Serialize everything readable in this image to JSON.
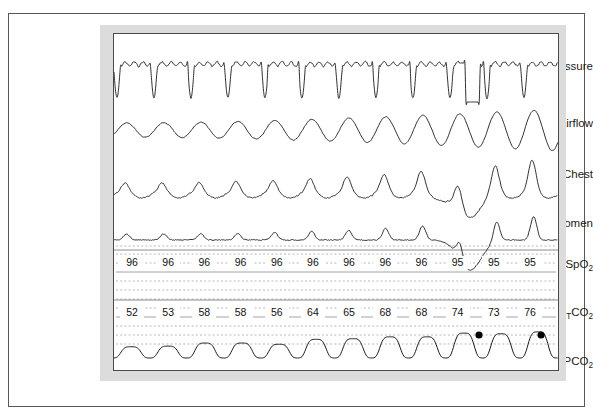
{
  "figure": {
    "type": "polysomnography-capnography-recording",
    "channels": [
      {
        "key": "nasal_pressure",
        "label": "Nasal pressure",
        "label_html_sub": ""
      },
      {
        "key": "airflow",
        "label": "Airflow",
        "label_html_sub": ""
      },
      {
        "key": "chest",
        "label": "Chest",
        "label_html_sub": ""
      },
      {
        "key": "abdomen",
        "label": "Abdomen",
        "label_html_sub": ""
      },
      {
        "key": "spo2",
        "label": "SpO",
        "label_html_sub": "2"
      },
      {
        "key": "petco2",
        "label": "P",
        "label_html_sub": "ET",
        "label_tail": "CO",
        "label_tail_sub": "2"
      },
      {
        "key": "pco2",
        "label": "PCO",
        "label_html_sub": "2"
      }
    ],
    "labels": {
      "nasal_pressure": "Nasal pressure",
      "airflow": "Airflow",
      "chest": "Chest",
      "abdomen": "Abdomen",
      "spo2_main": "SpO",
      "spo2_sub": "2",
      "petco2_p": "P",
      "petco2_et": "ET",
      "petco2_co": "CO",
      "petco2_sub": "2",
      "pco2_main": "PCO",
      "pco2_sub": "2"
    }
  },
  "chart_data": {
    "type": "line",
    "title": "",
    "xlabel": "",
    "ylabel": "",
    "grid": "dotted-horizontal",
    "legend_position": "left-labels",
    "colors": {
      "trace": "#1a1a1a",
      "gridline": "#8c8c8c",
      "panel_mat": "#dcdcdc",
      "plot_background": "#ffffff",
      "frame": "#585858",
      "marker": "#000000"
    },
    "series": [
      {
        "name": "Nasal pressure",
        "description": "Flow-limited breaths with sharp inspiratory downward deflections; one squared dropout near right",
        "n_breaths": 12
      },
      {
        "name": "Airflow",
        "description": "Smooth sinusoidal thermistor signal with crescendo amplitude toward the right",
        "n_breaths": 12
      },
      {
        "name": "Chest",
        "description": "Peaked effort waves increasing in amplitude, with deep excursion at right",
        "n_breaths": 12
      },
      {
        "name": "Abdomen",
        "description": "Low amplitude peaks early, large peak and deep trough at right (paradox)",
        "n_breaths": 12
      },
      {
        "name": "PCO2",
        "description": "Capnogram with rounded alveolar plateaus; plateau height rises toward the right",
        "n_breaths": 12
      }
    ],
    "spo2": {
      "label": "SpO2",
      "unit": "%",
      "values": [
        96,
        96,
        96,
        96,
        96,
        96,
        96,
        96,
        96,
        95,
        95,
        95
      ]
    },
    "petco2": {
      "label": "PETCO2",
      "unit": "mmHg",
      "values": [
        52,
        53,
        58,
        58,
        56,
        64,
        65,
        68,
        68,
        74,
        73,
        76
      ]
    },
    "markers": [
      {
        "name": "pco2-peak-marker-1",
        "series": "PCO2",
        "x_frac": 0.822,
        "note": "filled circle at capnogram plateau"
      },
      {
        "name": "pco2-peak-marker-2",
        "series": "PCO2",
        "x_frac": 0.962,
        "note": "filled circle at capnogram plateau"
      }
    ]
  }
}
